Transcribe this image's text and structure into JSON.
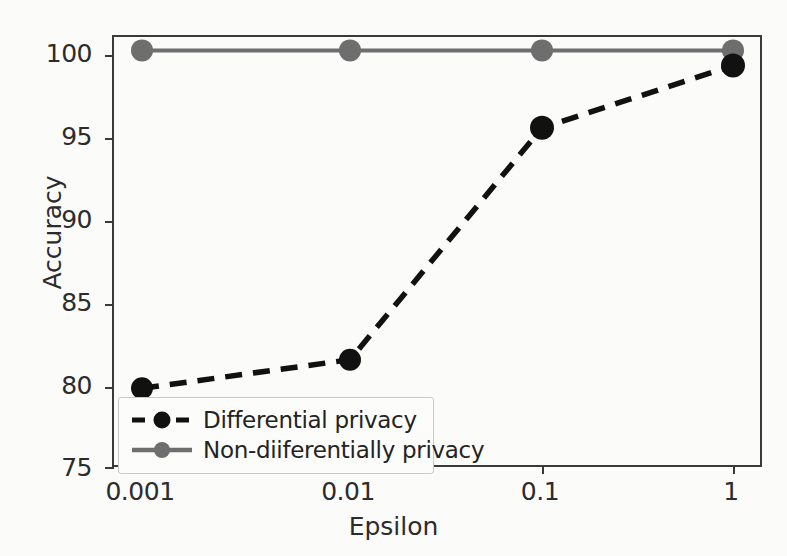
{
  "chart_data": {
    "type": "line",
    "title": "",
    "xlabel": "Epsilon",
    "ylabel": "Accuracy",
    "categories": [
      "0.001",
      "0.01",
      "0.1",
      "1"
    ],
    "x_tick_labels": [
      "0.001",
      "0.01",
      "0.1",
      "1"
    ],
    "y_tick_labels": [
      "75",
      "80",
      "85",
      "90",
      "95",
      "100"
    ],
    "y_ticks": [
      75,
      80,
      85,
      90,
      95,
      100
    ],
    "ylim": [
      75,
      100.7
    ],
    "xscale": "log",
    "grid": false,
    "legend_position": "lower-left",
    "series": [
      {
        "name": "Differential privacy",
        "values": [
          79.8,
          81.5,
          95.3,
          99.0
        ],
        "color": "#111111",
        "linestyle": "dashed",
        "marker": "circle"
      },
      {
        "name": "Non-diiferentially privacy",
        "values": [
          99.9,
          99.9,
          99.9,
          99.9
        ],
        "color": "#6e6e6e",
        "linestyle": "solid",
        "marker": "circle"
      }
    ]
  },
  "axes": {
    "x_label": "Epsilon",
    "y_label": "Accuracy",
    "y_ticks": [
      "75",
      "80",
      "85",
      "90",
      "95",
      "100"
    ],
    "x_ticks": [
      "0.001",
      "0.01",
      "0.1",
      "1"
    ]
  },
  "legend": {
    "entries": [
      {
        "label": "Differential privacy",
        "color": "#111111",
        "style": "dashed"
      },
      {
        "label": "Non-diiferentially privacy",
        "color": "#6e6e6e",
        "style": "solid"
      }
    ]
  },
  "colors": {
    "dp_line": "#111111",
    "nondp_line": "#6e6e6e",
    "axis": "#3a3a3a",
    "text": "#2c2c2c",
    "background": "#fbfbfa",
    "legend_border": "#c9c9c7"
  }
}
